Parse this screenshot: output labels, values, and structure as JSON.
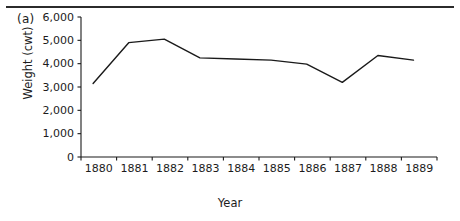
{
  "figure": {
    "panel_label": "(a)",
    "has_top_rule": true
  },
  "chart_data": {
    "type": "line",
    "title": "",
    "xlabel": "Year",
    "ylabel": "Weight (cwt)",
    "categories": [
      "1880",
      "1881",
      "1882",
      "1883",
      "1884",
      "1885",
      "1886",
      "1887",
      "1888",
      "1889"
    ],
    "values": [
      3150,
      4900,
      5050,
      4250,
      4200,
      4150,
      3980,
      3200,
      4350,
      4150
    ],
    "ylim": [
      0,
      6000
    ],
    "ytick_labels": [
      "0",
      "1,000",
      "2,000",
      "3,000",
      "4,000",
      "5,000",
      "6,000"
    ],
    "ytick_values": [
      0,
      1000,
      2000,
      3000,
      4000,
      5000,
      6000
    ],
    "grid": false,
    "legend": false,
    "line_color": "#1a1a1a"
  }
}
